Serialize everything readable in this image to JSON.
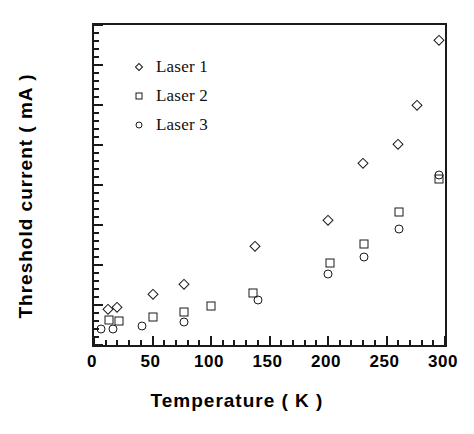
{
  "chart_data": {
    "type": "scatter",
    "title": "",
    "xlabel": "Temperature  ( K )",
    "ylabel": "Threshold current  ( mA )",
    "xlim": [
      0,
      300
    ],
    "ylim": [
      0,
      0.8
    ],
    "x_ticks": [
      0,
      50,
      100,
      150,
      200,
      250,
      300
    ],
    "x_tick_labels": [
      "0",
      "50",
      "100",
      "150",
      "200",
      "250",
      "300"
    ],
    "x_minor_step": 10,
    "y_ticks": [
      0.0,
      0.1,
      0.2,
      0.3,
      0.4,
      0.5,
      0.6,
      0.7,
      0.8
    ],
    "y_tick_labels": [
      "0.0",
      "0.1",
      "0.2",
      "0.3",
      "0.4",
      "0.5",
      "0.6",
      "0.7",
      "0.8"
    ],
    "y_minor_step": 0.02,
    "grid": false,
    "legend_position": "upper-left",
    "series": [
      {
        "name": "Laser 1",
        "marker": "diamond",
        "color": "#1a1a1a",
        "points": [
          {
            "x": 12,
            "y": 0.09
          },
          {
            "x": 20,
            "y": 0.096
          },
          {
            "x": 50,
            "y": 0.127
          },
          {
            "x": 77,
            "y": 0.152
          },
          {
            "x": 138,
            "y": 0.248
          },
          {
            "x": 200,
            "y": 0.312
          },
          {
            "x": 230,
            "y": 0.456
          },
          {
            "x": 260,
            "y": 0.502
          },
          {
            "x": 276,
            "y": 0.601
          },
          {
            "x": 295,
            "y": 0.762
          }
        ]
      },
      {
        "name": "Laser 2",
        "marker": "square",
        "color": "#1a1a1a",
        "points": [
          {
            "x": 13,
            "y": 0.062
          },
          {
            "x": 21,
            "y": 0.061
          },
          {
            "x": 50,
            "y": 0.071
          },
          {
            "x": 77,
            "y": 0.083
          },
          {
            "x": 100,
            "y": 0.097
          },
          {
            "x": 136,
            "y": 0.131
          },
          {
            "x": 202,
            "y": 0.204
          },
          {
            "x": 231,
            "y": 0.253
          },
          {
            "x": 261,
            "y": 0.332
          },
          {
            "x": 295,
            "y": 0.414
          }
        ]
      },
      {
        "name": "Laser 3",
        "marker": "circle",
        "color": "#1a1a1a",
        "points": [
          {
            "x": 6,
            "y": 0.04
          },
          {
            "x": 16,
            "y": 0.041
          },
          {
            "x": 41,
            "y": 0.048
          },
          {
            "x": 77,
            "y": 0.057
          },
          {
            "x": 140,
            "y": 0.112
          },
          {
            "x": 200,
            "y": 0.178
          },
          {
            "x": 231,
            "y": 0.22
          },
          {
            "x": 261,
            "y": 0.289
          },
          {
            "x": 295,
            "y": 0.424
          }
        ]
      }
    ]
  }
}
